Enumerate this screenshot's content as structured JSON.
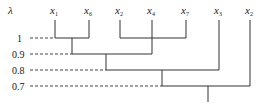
{
  "diagram": {
    "type": "dendrogram",
    "axis_label": "λ",
    "leaves": [
      {
        "name": "x",
        "sub": "1",
        "x": 55
      },
      {
        "name": "x",
        "sub": "6",
        "x": 89
      },
      {
        "name": "x",
        "sub": "2",
        "x": 120
      },
      {
        "name": "x",
        "sub": "4",
        "x": 152
      },
      {
        "name": "x",
        "sub": "7",
        "x": 186
      },
      {
        "name": "x",
        "sub": "3",
        "x": 219
      },
      {
        "name": "x",
        "sub": "2",
        "x": 250
      }
    ],
    "levels": [
      {
        "label": "1",
        "y": 38
      },
      {
        "label": "0.9",
        "y": 54
      },
      {
        "label": "0.8",
        "y": 70
      },
      {
        "label": "0.7",
        "y": 86
      }
    ],
    "merges": [
      {
        "level": "1",
        "members": [
          "x1",
          "x6"
        ]
      },
      {
        "level": "1",
        "members": [
          "x2",
          "x7"
        ]
      },
      {
        "level": "0.9",
        "members": [
          "{x1,x6}",
          "x4"
        ]
      },
      {
        "level": "0.8",
        "members": [
          "{x1,x6,x4}",
          "x3"
        ]
      },
      {
        "level": "0.7",
        "members": [
          "{x1,x6,x4,x3}",
          "x2"
        ]
      }
    ]
  }
}
